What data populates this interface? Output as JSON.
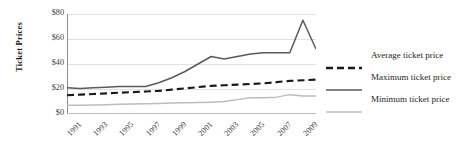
{
  "chart_data": {
    "type": "line",
    "title": "",
    "xlabel": "",
    "ylabel": "Ticket Prices",
    "ylim": [
      0,
      80
    ],
    "xlim": [
      1991,
      2010
    ],
    "grid": true,
    "y_ticks": [
      "$0",
      "$20",
      "$40",
      "$60",
      "$80"
    ],
    "y_tick_values": [
      0,
      20,
      40,
      60,
      80
    ],
    "x_tick_labels": [
      "1991",
      "1993",
      "1995",
      "1997",
      "1999",
      "2001",
      "2003",
      "2005",
      "2007",
      "2009"
    ],
    "x_tick_values": [
      1991,
      1993,
      1995,
      1997,
      1999,
      2001,
      2003,
      2005,
      2007,
      2009
    ],
    "x": [
      1991,
      1992,
      1993,
      1994,
      1995,
      1996,
      1997,
      1998,
      1999,
      2000,
      2001,
      2002,
      2003,
      2004,
      2005,
      2006,
      2007,
      2008,
      2009,
      2010
    ],
    "legend_position": "right",
    "series": [
      {
        "name": "Average ticket price",
        "style": "dashed",
        "color": "#1a1a1a",
        "values": [
          15,
          15.5,
          16,
          16.5,
          17,
          17.5,
          18,
          18.5,
          19.5,
          20.5,
          21.5,
          22.5,
          23,
          23.5,
          24,
          24.5,
          25.5,
          26.5,
          27,
          27.5
        ]
      },
      {
        "name": "Maximum ticket price",
        "style": "solid",
        "color": "#5a5a5a",
        "values": [
          21,
          20.5,
          21,
          21.5,
          22,
          22,
          22,
          25,
          29,
          34,
          40,
          46,
          44,
          46,
          48,
          49,
          49,
          49,
          75,
          52
        ]
      },
      {
        "name": "Minimum ticket price",
        "style": "solid",
        "color": "#bdbdbd",
        "values": [
          7,
          7,
          7.2,
          7.5,
          7.8,
          8,
          8.2,
          8.5,
          8.8,
          9,
          9.2,
          9.5,
          10,
          11.5,
          13,
          13,
          13.5,
          15.5,
          14.5,
          14.5
        ]
      }
    ]
  },
  "legend": {
    "items": [
      {
        "label": "Average ticket price"
      },
      {
        "label": "Maximum ticket price"
      },
      {
        "label": "Minimum ticket price"
      }
    ]
  },
  "axis": {
    "y_title": "Ticket Prices"
  }
}
